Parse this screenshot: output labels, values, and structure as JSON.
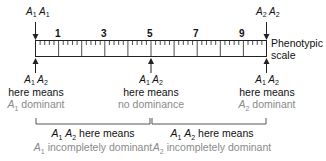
{
  "diagram": {
    "scale": {
      "label_line1": "Phenotypic",
      "label_line2": "scale",
      "min": 0,
      "max": 10,
      "numbered_ticks": [
        "1",
        "3",
        "5",
        "7",
        "9"
      ]
    },
    "top_markers": {
      "left": {
        "allele1": "A",
        "sub1": "1",
        "allele2": "A",
        "sub2": "1"
      },
      "right": {
        "allele1": "A",
        "sub1": "2",
        "allele2": "A",
        "sub2": "2"
      }
    },
    "bottom_markers": [
      {
        "allele1": "A",
        "sub1": "1",
        "allele2": "A",
        "sub2": "2",
        "line1": "here means",
        "line2_a": "A",
        "line2_sub": "1",
        "line2_b": " dominant"
      },
      {
        "allele1": "A",
        "sub1": "1",
        "allele2": "A",
        "sub2": "2",
        "line1": "here means",
        "line2": "no dominance"
      },
      {
        "allele1": "A",
        "sub1": "1",
        "allele2": "A",
        "sub2": "2",
        "line1": "here means",
        "line2_a": "A",
        "line2_sub": "2",
        "line2_b": " dominant"
      }
    ],
    "brackets": [
      {
        "allele1": "A",
        "sub1": "1",
        "allele2": "A",
        "sub2": "2",
        "line1": " here means",
        "line2_a": "A",
        "line2_sub": "1",
        "line2_b": " incompletely dominant"
      },
      {
        "allele1": "A",
        "sub1": "1",
        "allele2": "A",
        "sub2": "2",
        "line1": " here means",
        "line2_a": "A",
        "line2_sub": "2",
        "line2_b": " incompletely dominant"
      }
    ],
    "colors": {
      "line": "#222222",
      "secondary_text": "#8a8a8a"
    }
  }
}
